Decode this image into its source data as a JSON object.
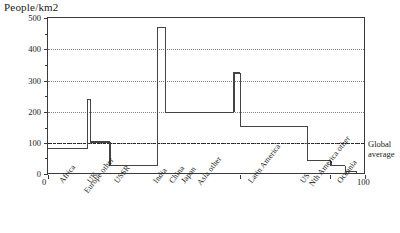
{
  "chart_data": {
    "type": "bar",
    "title": "People/km2",
    "ylabel": "People/km2",
    "xlabel": "",
    "ylim": [
      0,
      500
    ],
    "xlim": [
      0,
      100
    ],
    "grid": true,
    "legend_position": "none",
    "y_ticks": [
      0,
      100,
      200,
      300,
      400,
      500
    ],
    "y_minor_ticks": [
      50,
      150,
      250,
      350,
      450
    ],
    "x_ticks": [
      0,
      100
    ],
    "x_tick_labels": [
      "0",
      "100"
    ],
    "x_axis_description": "Cumulative share of world population (%)",
    "categories": [
      "Africa",
      "UK",
      "Europe other",
      "USSR",
      "India",
      "China",
      "Japan",
      "Asia other",
      "Latin America",
      "US",
      "Nth America other",
      "Oceania"
    ],
    "values": [
      85,
      240,
      105,
      30,
      470,
      200,
      325,
      155,
      45,
      30,
      12,
      4
    ],
    "segment_starts": [
      0,
      12.5,
      13.5,
      19.5,
      34.5,
      37.0,
      58.5,
      60.5,
      81.5,
      89.0,
      93.5,
      97.0
    ],
    "segment_ends": [
      12.5,
      13.5,
      19.5,
      34.5,
      37.0,
      58.5,
      60.5,
      81.5,
      89.0,
      93.5,
      97.0,
      100.0
    ],
    "annotations": [
      {
        "name": "global-average",
        "label_line1": "Global",
        "label_line2": "average",
        "value": 100,
        "style": "dash-dot horizontal reference line"
      }
    ]
  },
  "axis": {
    "y_title": "People/km2",
    "x_start_label": "0",
    "x_end_label": "100"
  },
  "annotation": {
    "global_average_line1": "Global",
    "global_average_line2": "average"
  }
}
